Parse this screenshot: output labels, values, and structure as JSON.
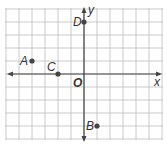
{
  "figure": {
    "type": "coordinate-plane",
    "origin_label": "O",
    "x_axis_label": "x",
    "y_axis_label": "y",
    "x_range": [
      -6,
      6
    ],
    "y_range": [
      -5,
      5
    ],
    "grid": true,
    "colors": {
      "grid": "#bdbdbd",
      "axis": "#444444",
      "point": "#444444",
      "text": "#333333"
    }
  },
  "points": [
    {
      "label": "A",
      "x": -4,
      "y": 1
    },
    {
      "label": "B",
      "x": 1,
      "y": -4
    },
    {
      "label": "C",
      "x": -2,
      "y": 0
    },
    {
      "label": "D",
      "x": 0,
      "y": 4
    }
  ]
}
